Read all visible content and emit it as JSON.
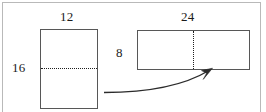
{
  "figure": {
    "background_color": "#ffffff",
    "frame_color": "#b9b9b9",
    "shape_stroke_color": "#575757",
    "dash_color": "#1f1f1f",
    "text_color": "#1b1b1b"
  },
  "labels": {
    "left_rect_width": "12",
    "left_rect_height": "16",
    "right_rect_height": "8",
    "right_rect_width": "24"
  },
  "shapes": {
    "left_rectangle": {
      "name": "tall-rectangle",
      "width_label": "12",
      "height_label": "16",
      "divider": "horizontal-dotted-bisector"
    },
    "right_rectangle": {
      "name": "wide-rectangle",
      "width_label": "24",
      "height_label": "8",
      "divider": "vertical-dotted-bisector"
    }
  },
  "annotations": {
    "arrow": {
      "name": "curved-transformation-arrow",
      "direction": "left-to-right-upward"
    }
  }
}
